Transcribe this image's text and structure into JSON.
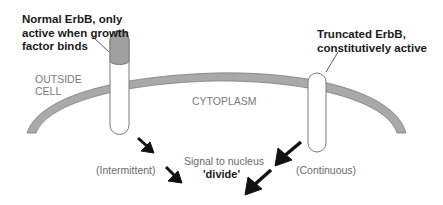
{
  "labels": {
    "normal_receptor": [
      "Normal ErbB, only",
      "active when growth",
      "factor binds"
    ],
    "truncated_receptor": [
      "Truncated ErbB,",
      "constitutively active"
    ],
    "outside_cell": [
      "OUTSIDE",
      "CELL"
    ],
    "cytoplasm": "CYTOPLASM",
    "signal": "Signal to nucleus",
    "divide": "'divide'",
    "intermittent": "(Intermittent)",
    "continuous": "(Continuous)"
  },
  "colors": {
    "membrane_fill": "#a9a9a9",
    "membrane_stroke": "#7d7d7d",
    "receptor_outline": "#7a7a7a",
    "ligand_cap_fill": "#a0a0a0",
    "arrow": "#111111",
    "background": "#ffffff"
  }
}
